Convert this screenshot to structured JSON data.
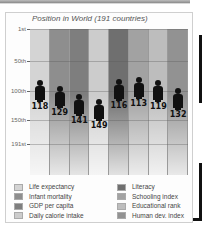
{
  "chart_data": {
    "type": "bar",
    "title": "Position in World (191 countries)",
    "xlabel": "",
    "ylabel": "",
    "y_axis": {
      "ticks": [
        "1st",
        "50th",
        "100th",
        "150th",
        "191st"
      ],
      "inverted": true,
      "range": [
        1,
        191
      ]
    },
    "grid": true,
    "legend_position": "bottom",
    "categories": [
      "Life expectancy",
      "Infant mortality",
      "GDP per capita",
      "Daily calorie intake",
      "Literacy",
      "Schooling index",
      "Educational rank",
      "Human dev. index"
    ],
    "values": [
      118,
      129,
      141,
      149,
      116,
      113,
      119,
      132
    ],
    "colors": [
      "#d4d4d4",
      "#8e8e8e",
      "#7e7e7e",
      "#cccccc",
      "#6f6f6f",
      "#a2a2a2",
      "#bdbdbd",
      "#929292"
    ],
    "marker": "person-icon"
  },
  "yticks": [
    {
      "label": "1st",
      "y": 0
    },
    {
      "label": "50th",
      "y": 32
    },
    {
      "label": "100th",
      "y": 62
    },
    {
      "label": "150th",
      "y": 91
    },
    {
      "label": "191st",
      "y": 115
    }
  ],
  "legend": {
    "left": [
      "Life expectancy",
      "Infant mortality",
      "GDP per capita",
      "Daily calorie intake"
    ],
    "right": [
      "Literacy",
      "Schooling index",
      "Educational rank",
      "Human dev. index"
    ]
  }
}
